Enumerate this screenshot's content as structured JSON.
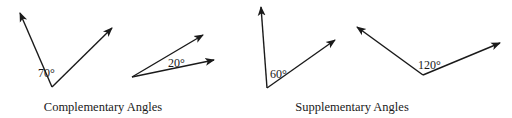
{
  "diagram": {
    "groups": [
      {
        "caption": "Complementary Angles",
        "angles": [
          {
            "label": "70°",
            "degrees": 70
          },
          {
            "label": "20°",
            "degrees": 20
          }
        ]
      },
      {
        "caption": "Supplementary Angles",
        "angles": [
          {
            "label": "60°",
            "degrees": 60
          },
          {
            "label": "120°",
            "degrees": 120
          }
        ]
      }
    ],
    "colors": {
      "stroke": "#1a1a1a",
      "background": "#ffffff"
    }
  }
}
